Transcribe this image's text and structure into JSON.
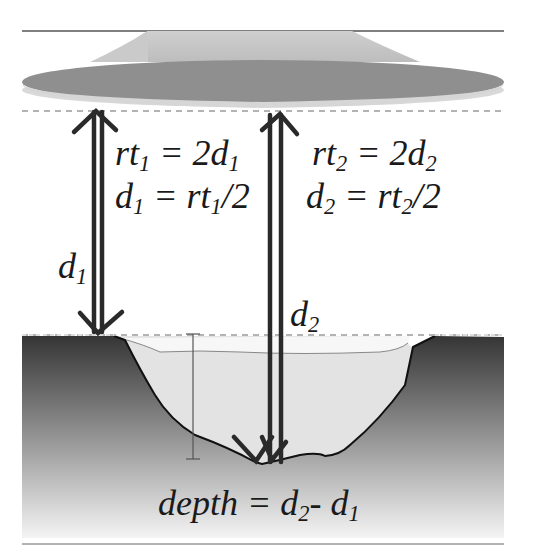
{
  "diagram": {
    "labels": {
      "rt1_eq": {
        "left": "rt",
        "sub": "1",
        "mid": " = 2d",
        "sub2": "1"
      },
      "d1_eq": {
        "left": "d",
        "sub": "1",
        "mid": " = rt",
        "sub2": "1",
        "right": "/2"
      },
      "rt2_eq": {
        "left": "rt",
        "sub": "2",
        "mid": " = 2d",
        "sub2": "2"
      },
      "d2_eq": {
        "left": "d",
        "sub": "2",
        "mid": " = rt",
        "sub2": "2",
        "right": "/2"
      },
      "d1_label": {
        "left": "d",
        "sub": "1"
      },
      "d2_label": {
        "left": "d",
        "sub": "2"
      },
      "depth_eq": {
        "left": "depth = d",
        "sub": "2",
        "mid": "- d",
        "sub2": "1"
      }
    },
    "colors": {
      "arrow": "#2a2a2a",
      "platform_top": "#c4c4c4",
      "platform_mid": "#8e8e8e",
      "platform_bottom": "#d8d8d8",
      "ground_top": "#3a3a3a",
      "ground_bottom": "#f2f2f2",
      "crater_fill": "#e4e4e4",
      "dashed_line": "#b0b0b0",
      "rule_line": "#555555"
    }
  }
}
